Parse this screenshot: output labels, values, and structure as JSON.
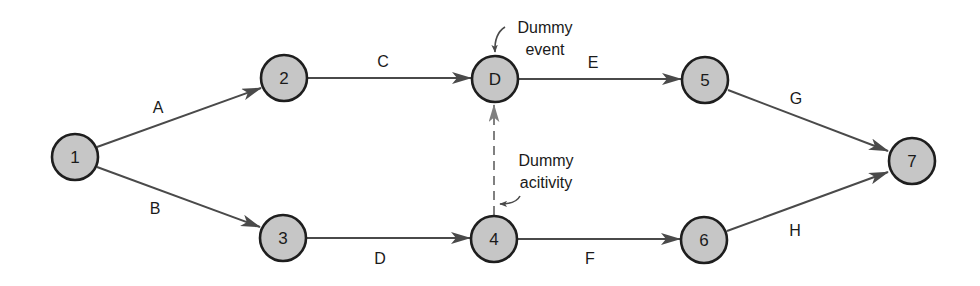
{
  "diagram": {
    "type": "activity-on-arrow network",
    "colors": {
      "node_fill": "#c6c6c6",
      "node_stroke": "#1e1e1e",
      "edge": "#4a4a4a",
      "dummy_edge": "#808080",
      "text": "#1a1a1a"
    },
    "nodes": [
      {
        "id": "1",
        "label": "1",
        "x": 75,
        "y": 157
      },
      {
        "id": "2",
        "label": "2",
        "x": 284,
        "y": 78
      },
      {
        "id": "3",
        "label": "3",
        "x": 283,
        "y": 238
      },
      {
        "id": "D",
        "label": "D",
        "x": 495,
        "y": 79
      },
      {
        "id": "4",
        "label": "4",
        "x": 494,
        "y": 239
      },
      {
        "id": "5",
        "label": "5",
        "x": 705,
        "y": 80
      },
      {
        "id": "6",
        "label": "6",
        "x": 704,
        "y": 240
      },
      {
        "id": "7",
        "label": "7",
        "x": 912,
        "y": 161
      }
    ],
    "edges": [
      {
        "label": "A",
        "from": "1",
        "to": "2",
        "dummy": false
      },
      {
        "label": "B",
        "from": "1",
        "to": "3",
        "dummy": false
      },
      {
        "label": "C",
        "from": "2",
        "to": "D",
        "dummy": false
      },
      {
        "label": "D",
        "from": "3",
        "to": "4",
        "dummy": false
      },
      {
        "label": "E",
        "from": "D",
        "to": "5",
        "dummy": false
      },
      {
        "label": "F",
        "from": "4",
        "to": "6",
        "dummy": false
      },
      {
        "label": "G",
        "from": "5",
        "to": "7",
        "dummy": false
      },
      {
        "label": "H",
        "from": "6",
        "to": "7",
        "dummy": false
      },
      {
        "label": "",
        "from": "4",
        "to": "D",
        "dummy": true
      }
    ],
    "annotations": {
      "dummy_event": {
        "line1": "Dummy",
        "line2": "event"
      },
      "dummy_activity": {
        "line1": "Dummy",
        "line2": "acitivity"
      }
    }
  }
}
